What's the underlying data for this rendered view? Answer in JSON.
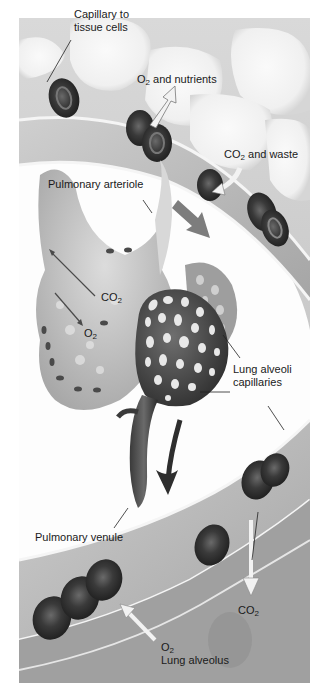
{
  "figure": {
    "frame": {
      "x": 19,
      "y": 18,
      "width": 291,
      "height": 665
    }
  },
  "labels": {
    "capillary_to_tissue": {
      "line1": "Capillary to",
      "line2": "tissue cells"
    },
    "o2_nutrients": {
      "pre": "O",
      "sub": "2",
      "post": " and nutrients"
    },
    "co2_waste": {
      "pre": "CO",
      "sub": "2",
      "post": " and waste"
    },
    "pulmonary_arteriole": "Pulmonary arteriole",
    "co2_left": {
      "pre": "CO",
      "sub": "2"
    },
    "o2_left": {
      "pre": "O",
      "sub": "2"
    },
    "lung_alveoli_capillaries": {
      "line1": "Lung alveoli",
      "line2": "capillaries"
    },
    "pulmonary_venule": "Pulmonary venule",
    "co2_bottom": {
      "pre": "CO",
      "sub": "2"
    },
    "o2_bottom": {
      "pre": "O",
      "sub": "2"
    },
    "lung_alveolus": "Lung alveolus"
  },
  "colors": {
    "background": "#ffffff",
    "tissue_light": "#e4e4e4",
    "tissue_mid": "#b8b8b8",
    "vessel_wall": "#d2d2d2",
    "rbc_dark": "#2e2e2e",
    "rbc_mid": "#5a5a5a",
    "arrow_light": "#eeeeee",
    "arrow_dark": "#3a3a3a",
    "text": "#1a1a1a"
  }
}
